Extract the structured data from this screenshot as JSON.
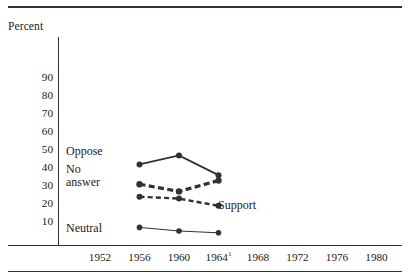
{
  "figure": {
    "y_axis_title": "Percent",
    "footnote_marker": "1"
  },
  "axes": {
    "y_ticks": [
      {
        "label": "90",
        "value": 90
      },
      {
        "label": "80",
        "value": 80
      },
      {
        "label": "70",
        "value": 70
      },
      {
        "label": "60",
        "value": 60
      },
      {
        "label": "50",
        "value": 50
      },
      {
        "label": "40",
        "value": 40
      },
      {
        "label": "30",
        "value": 30
      },
      {
        "label": "20",
        "value": 20
      },
      {
        "label": "10",
        "value": 10
      }
    ],
    "x_ticks": [
      {
        "label": "1952",
        "value": 1952,
        "superscript": ""
      },
      {
        "label": "1956",
        "value": 1956,
        "superscript": ""
      },
      {
        "label": "1960",
        "value": 1960,
        "superscript": ""
      },
      {
        "label": "1964",
        "value": 1964,
        "superscript": "1"
      },
      {
        "label": "1968",
        "value": 1968,
        "superscript": ""
      },
      {
        "label": "1972",
        "value": 1972,
        "superscript": ""
      },
      {
        "label": "1976",
        "value": 1976,
        "superscript": ""
      },
      {
        "label": "1980",
        "value": 1980,
        "superscript": ""
      }
    ]
  },
  "series_labels": {
    "oppose": "Oppose",
    "no_answer_line1": "No",
    "no_answer_line2": "answer",
    "support": "Support",
    "neutral": "Neutral"
  },
  "colors": {
    "ink": "#33312f",
    "background": "#ffffff"
  },
  "chart_data": {
    "type": "line",
    "title": "",
    "xlabel": "",
    "ylabel": "Percent",
    "xlim": [
      1950,
      1982
    ],
    "ylim": [
      0,
      95
    ],
    "grid": false,
    "legend": "inline-labels",
    "x": [
      1956,
      1960,
      1964
    ],
    "categories": [
      "1952",
      "1956",
      "1960",
      "1964",
      "1968",
      "1972",
      "1976",
      "1980"
    ],
    "series": [
      {
        "name": "Oppose",
        "style": "solid-thick",
        "marker": "circle",
        "x": [
          1956,
          1960,
          1964
        ],
        "values": [
          42,
          47,
          36
        ]
      },
      {
        "name": "No answer",
        "style": "dashed-thick",
        "marker": "circle",
        "x": [
          1956,
          1960,
          1964
        ],
        "values": [
          31,
          27,
          33
        ]
      },
      {
        "name": "Support",
        "style": "dashed-thin",
        "marker": "circle",
        "x": [
          1956,
          1960,
          1964
        ],
        "values": [
          24,
          23,
          19
        ]
      },
      {
        "name": "Neutral",
        "style": "solid-thin",
        "marker": "circle",
        "x": [
          1956,
          1960,
          1964
        ],
        "values": [
          7,
          5,
          4
        ]
      }
    ]
  }
}
